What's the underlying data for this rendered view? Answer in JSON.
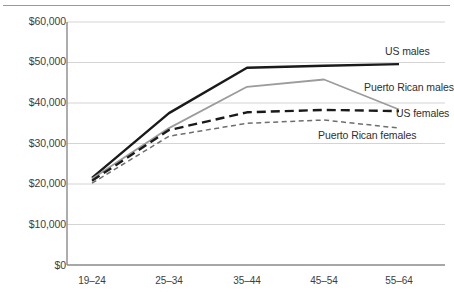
{
  "chart_data": {
    "type": "line",
    "title": "",
    "subtitle": "",
    "xlabel": "",
    "ylabel": "",
    "categories": [
      "19–24",
      "25–34",
      "35–44",
      "45–54",
      "55–64"
    ],
    "ylim": [
      0,
      60000
    ],
    "ytick_labels": [
      "$0",
      "$10,000",
      "$20,000",
      "$30,000",
      "$40,000",
      "$50,000",
      "$60,000"
    ],
    "ytick_values": [
      0,
      10000,
      20000,
      30000,
      40000,
      50000,
      60000
    ],
    "grid": true,
    "grid_axis": "y",
    "legend_position": "inline-right-of-line-ends",
    "series": [
      {
        "name": "US males",
        "values": [
          21500,
          37500,
          48700,
          49200,
          49600
        ],
        "color": "#1a1a1a",
        "style": "solid",
        "width": 2.4,
        "label_x": 385,
        "label_y": 52
      },
      {
        "name": "Puerto Rican males",
        "values": [
          21300,
          33800,
          44000,
          45800,
          38400
        ],
        "color": "#9c9c9c",
        "style": "solid",
        "width": 1.8,
        "label_x": 364,
        "label_y": 88
      },
      {
        "name": "US females",
        "values": [
          20800,
          33300,
          37700,
          38300,
          38000
        ],
        "color": "#1a1a1a",
        "style": "dashed",
        "width": 2.4,
        "label_x": 396,
        "label_y": 114
      },
      {
        "name": "Puerto Rican females",
        "values": [
          20200,
          31800,
          35000,
          35800,
          33800
        ],
        "color": "#6e6e6e",
        "style": "dashed-fine",
        "width": 1.5,
        "label_x": 318,
        "label_y": 136
      }
    ]
  },
  "axes": {
    "x_label_y": 281,
    "x_positions": [
      92,
      169,
      247,
      324,
      399
    ],
    "plot_left": 67,
    "plot_right": 445,
    "plot_top": 22,
    "plot_bottom": 265
  }
}
